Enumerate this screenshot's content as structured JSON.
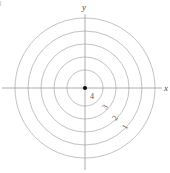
{
  "figure": {
    "background_color": "#ffffff",
    "width": 170,
    "height": 173
  },
  "axes": {
    "origin": {
      "x": 85,
      "y": 88
    },
    "color": "#9a9a9a",
    "x_axis": {
      "label": "x",
      "start_x": 2,
      "end_x": 162,
      "y": 88
    },
    "y_axis": {
      "label": "y",
      "x": 85,
      "start_y": 14,
      "end_y": 170
    },
    "x_label_pos": {
      "x": 164,
      "y": 91
    },
    "y_label_pos": {
      "x": 82,
      "y": 10
    }
  },
  "origin_point": {
    "name": "origin-dot",
    "radius": 2.1,
    "color": "#111111"
  },
  "chart_data": {
    "type": "line",
    "title": "",
    "xlabel": "x",
    "ylabel": "y",
    "grid": true,
    "legend": "none",
    "circle_color": "#b3b3b3",
    "circles": [
      {
        "label": "4",
        "radius_px": 18
      },
      {
        "label": "3",
        "radius_px": 31
      },
      {
        "label": "2",
        "radius_px": 44
      },
      {
        "label": "1",
        "radius_px": 57
      },
      {
        "label": "",
        "radius_px": 70
      }
    ]
  },
  "labels": {
    "origin_value": {
      "text": "4",
      "x": 90,
      "y": 99,
      "rotation": 0
    },
    "diagonal": [
      {
        "text": "3",
        "x": 106,
        "y": 110,
        "rotation": -55
      },
      {
        "text": "2",
        "x": 116,
        "y": 121,
        "rotation": -55
      },
      {
        "text": "1",
        "x": 126,
        "y": 130,
        "rotation": -55
      }
    ]
  }
}
